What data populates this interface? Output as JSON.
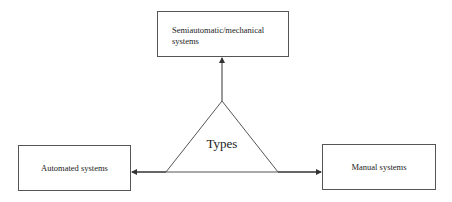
{
  "diagram": {
    "center": {
      "label": "Types"
    },
    "nodes": [
      {
        "id": "top",
        "label": "Semiautomatic/mechanical systems",
        "position": "top"
      },
      {
        "id": "left",
        "label": "Automated systems",
        "position": "left"
      },
      {
        "id": "right",
        "label": "Manual systems",
        "position": "right"
      }
    ],
    "edges": [
      {
        "from": "center",
        "to": "top",
        "arrow": "end"
      },
      {
        "from": "center",
        "to": "left",
        "arrow": "end"
      },
      {
        "from": "center",
        "to": "right",
        "arrow": "end"
      }
    ],
    "colors": {
      "stroke": "#444444",
      "text": "#222222",
      "background": "#ffffff"
    }
  }
}
